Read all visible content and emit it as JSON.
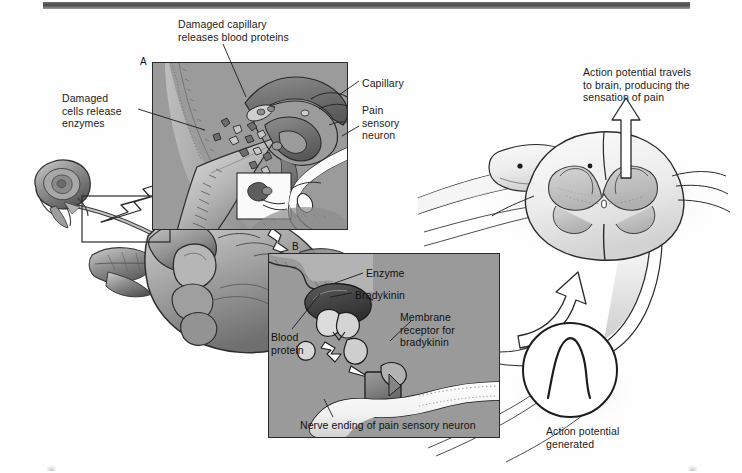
{
  "figure": {
    "panel_a_letter": "A",
    "panel_b_letter": "B"
  },
  "colors": {
    "panel_fill": "#9b9b9b",
    "panel_border": "#2a2a2a",
    "capillary_fill": "#6e6e6e",
    "enzyme_fill": "#4a4a4a",
    "text": "#1b1b1b",
    "rule": "#4a4a4a",
    "axon_fill": "#f4f4f4"
  },
  "labels": {
    "damaged_capillary": "Damaged capillary\nreleases blood proteins",
    "damaged_cells": "Damaged\ncells release\nenzymes",
    "capillary": "Capillary",
    "pain_sensory_neuron": "Pain\nsensory\nneuron",
    "action_potential_brain": "Action potential travels\nto brain, producing the\nsensation of pain",
    "action_potential_generated": "Action potential\ngenerated",
    "enzyme": "Enzyme",
    "bradykinin": "Bradykinin",
    "blood_protein": "Blood\nprotein",
    "membrane_receptor": "Membrane\nreceptor for\nbradykinin",
    "nerve_ending": "Nerve ending of pain sensory neuron"
  },
  "icons": {
    "arrow_up": "arrow-up-icon",
    "arrow_curved": "curved-arrow-icon",
    "arrow_zigzag": "zigzag-arrow-icon",
    "spike": "action-potential-spike-icon"
  }
}
